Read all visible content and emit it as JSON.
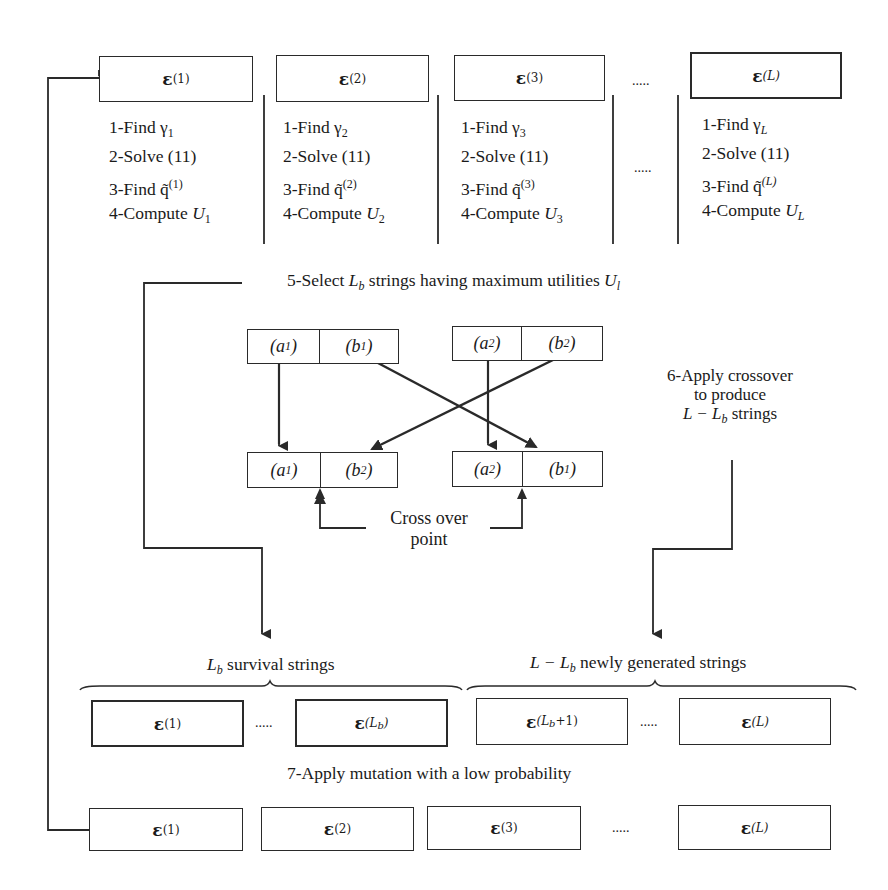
{
  "diagram": {
    "type": "genetic-algorithm-flow",
    "generation_row": {
      "strings": [
        {
          "symbol": "ε",
          "superscript": "(1)"
        },
        {
          "symbol": "ε",
          "superscript": "(2)"
        },
        {
          "symbol": "ε",
          "superscript": "(3)"
        },
        {
          "symbol": "ε",
          "superscript": "(L)"
        }
      ],
      "ellipsis_top": ".....",
      "ellipsis_steps": ".....",
      "steps": [
        {
          "find_gamma": "1-Find γ",
          "gamma_sub": "1",
          "solve": "2-Solve (11)",
          "find_q": "3-Find q̃",
          "q_sup": "(1)",
          "compute": "4-Compute ",
          "u": "U",
          "u_sub": "1"
        },
        {
          "find_gamma": "1-Find γ",
          "gamma_sub": "2",
          "solve": "2-Solve (11)",
          "find_q": "3-Find q̃",
          "q_sup": "(2)",
          "compute": "4-Compute ",
          "u": "U",
          "u_sub": "2"
        },
        {
          "find_gamma": "1-Find γ",
          "gamma_sub": "3",
          "solve": "2-Solve (11)",
          "find_q": "3-Find q̃",
          "q_sup": "(3)",
          "compute": "4-Compute ",
          "u": "U",
          "u_sub": "3"
        },
        {
          "find_gamma": "1-Find γ",
          "gamma_sub": "L",
          "solve": "2-Solve (11)",
          "find_q": "3-Find q̃",
          "q_sup": "(L)",
          "compute": "4-Compute ",
          "u": "U",
          "u_sub": "L"
        }
      ]
    },
    "step5": {
      "prefix": "5-Select ",
      "var": "L",
      "var_sub": "b",
      "middle": " strings having maximum utilities ",
      "u": "U",
      "u_sub": "l"
    },
    "crossover": {
      "parents": [
        {
          "a": "(a",
          "a_sub": "1",
          "a_close": ")",
          "b": "(b",
          "b_sub": "1",
          "b_close": ")"
        },
        {
          "a": "(a",
          "a_sub": "2",
          "a_close": ")",
          "b": "(b",
          "b_sub": "2",
          "b_close": ")"
        }
      ],
      "children": [
        {
          "a": "(a",
          "a_sub": "1",
          "a_close": ")",
          "b": "(b",
          "b_sub": "2",
          "b_close": ")"
        },
        {
          "a": "(a",
          "a_sub": "2",
          "a_close": ")",
          "b": "(b",
          "b_sub": "1",
          "b_close": ")"
        }
      ],
      "crossover_point_line1": "Cross over",
      "crossover_point_line2": "point"
    },
    "step6": {
      "line1": "6-Apply crossover",
      "line2": "to produce",
      "line3_var": "L − L",
      "line3_sub": "b",
      "line3_rest": " strings"
    },
    "survival": {
      "brace_label_var": "L",
      "brace_label_sub": "b",
      "brace_label_rest": " survival strings",
      "strings": [
        {
          "symbol": "ε",
          "superscript": "(1)"
        },
        {
          "symbol": "ε",
          "superscript": "(L",
          "superscript_sub": "b",
          "superscript_close": ")"
        }
      ],
      "ellipsis": "....."
    },
    "newly_generated": {
      "brace_label_var": "L − L",
      "brace_label_sub": "b",
      "brace_label_rest": " newly generated strings",
      "strings": [
        {
          "symbol": "ε",
          "superscript": "(L",
          "superscript_sub": "b",
          "superscript_close": "+1)"
        },
        {
          "symbol": "ε",
          "superscript": "(L)"
        }
      ],
      "ellipsis": "....."
    },
    "step7": {
      "label": "7-Apply mutation with a low probability"
    },
    "mutated_row": {
      "strings": [
        {
          "symbol": "ε",
          "superscript": "(1)"
        },
        {
          "symbol": "ε",
          "superscript": "(2)"
        },
        {
          "symbol": "ε",
          "superscript": "(3)"
        },
        {
          "symbol": "ε",
          "superscript": "(L)"
        }
      ],
      "ellipsis": "....."
    },
    "colors": {
      "stroke": "#2a2a2a",
      "text": "#1a1a1a",
      "background": "#ffffff"
    }
  }
}
